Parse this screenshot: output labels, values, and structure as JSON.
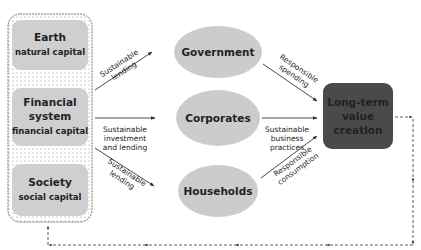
{
  "capitals": [
    {
      "title": "Earth",
      "subtitle": "natural capital"
    },
    {
      "title_line1": "Financial",
      "title_line2": "system",
      "subtitle": "financial capital"
    },
    {
      "title": "Society",
      "subtitle": "social capital"
    }
  ],
  "actors": [
    {
      "label": "Government"
    },
    {
      "label": "Corporates"
    },
    {
      "label": "Households"
    }
  ],
  "outcome": {
    "line1": "Long-term",
    "line2": "value",
    "line3": "creation"
  },
  "flows_in": [
    {
      "line1": "Sustainable",
      "line2": "lending"
    },
    {
      "line1": "Sustainable",
      "line2": "investment",
      "line3": "and lending"
    },
    {
      "line1": "Sustainable",
      "line2": "lending"
    }
  ],
  "flows_out": [
    {
      "line1": "Responsible",
      "line2": "spending"
    },
    {
      "line1": "Sustainable",
      "line2": "business",
      "line3": "practices"
    },
    {
      "line1": "Responsible",
      "line2": "consumption"
    }
  ],
  "colors": {
    "capital_box": "#cfcfcf",
    "actor_ellipse": "#cccccc",
    "outcome_box": "#4a4a4a",
    "outcome_text": "#ffffff",
    "line": "#333333"
  }
}
